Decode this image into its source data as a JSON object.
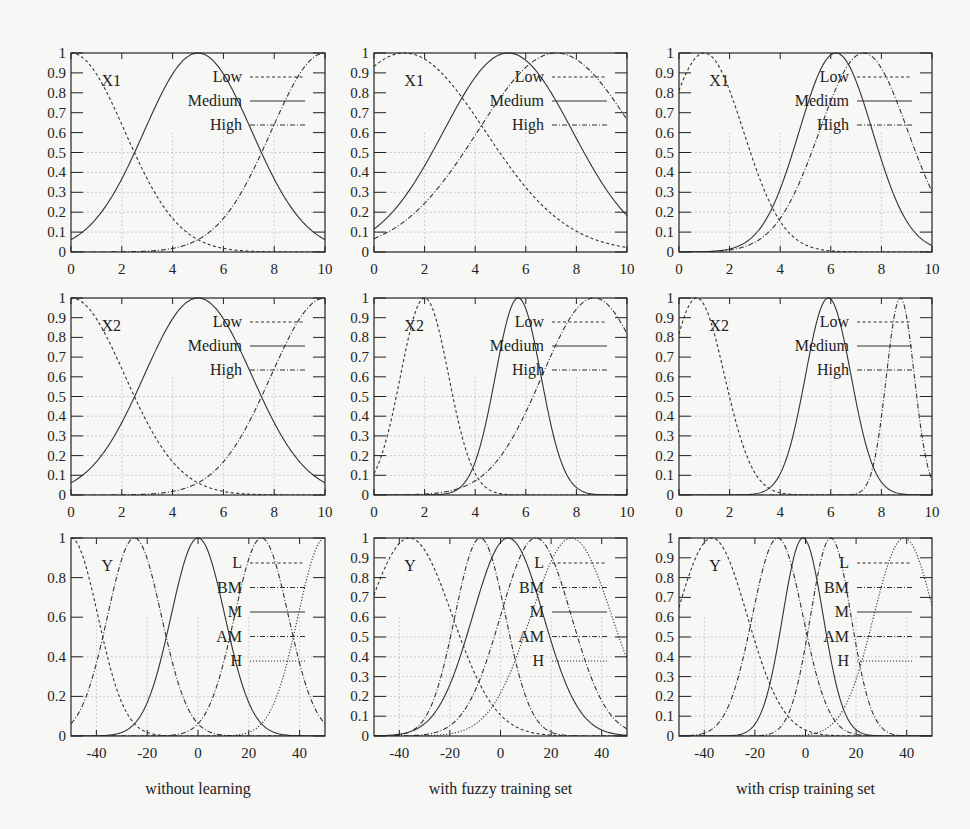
{
  "figure": {
    "rows": [
      "X1",
      "X2",
      "Y"
    ],
    "columns": [
      "without learning",
      "with fuzzy training set",
      "with crisp training set"
    ]
  },
  "chart_data": [
    {
      "type": "line",
      "id": "x1-without",
      "row": 0,
      "col": 0,
      "var_label": "X1",
      "xlabel": "",
      "ylabel": "",
      "xlim": [
        0,
        10
      ],
      "ylim": [
        0,
        1
      ],
      "xticks": [
        0,
        2,
        4,
        6,
        8,
        10
      ],
      "yticks": [
        0,
        0.1,
        0.2,
        0.3,
        0.4,
        0.5,
        0.6,
        0.7,
        0.8,
        0.9,
        1
      ],
      "ytick_labels": [
        "0",
        "0.1",
        "0.2",
        "0.3",
        "0.4",
        "0.5",
        "0.6",
        "0.7",
        "0.8",
        "0.9",
        "1"
      ],
      "grid": true,
      "legend_position": "upper right",
      "series": [
        {
          "name": "Low",
          "style": "dashed",
          "center": 0,
          "sigma": 2.12
        },
        {
          "name": "Medium",
          "style": "solid",
          "center": 5,
          "sigma": 2.12
        },
        {
          "name": "High",
          "style": "dashdot",
          "center": 10,
          "sigma": 2.12
        }
      ]
    },
    {
      "type": "line",
      "id": "x1-fuzzy",
      "row": 0,
      "col": 1,
      "var_label": "X1",
      "xlabel": "",
      "ylabel": "",
      "xlim": [
        0,
        10
      ],
      "ylim": [
        0,
        1
      ],
      "xticks": [
        0,
        2,
        4,
        6,
        8,
        10
      ],
      "yticks": [
        0,
        0.1,
        0.2,
        0.3,
        0.4,
        0.5,
        0.6,
        0.7,
        0.8,
        0.9,
        1
      ],
      "ytick_labels": [
        "0",
        "0.1",
        "0.2",
        "0.3",
        "0.4",
        "0.5",
        "0.6",
        "0.7",
        "0.8",
        "0.9",
        "1"
      ],
      "grid": true,
      "legend_position": "upper right",
      "series": [
        {
          "name": "Low",
          "style": "dashed",
          "center": 1.2,
          "sigma": 3.2
        },
        {
          "name": "Medium",
          "style": "solid",
          "center": 5.3,
          "sigma": 2.55
        },
        {
          "name": "High",
          "style": "dashdot",
          "center": 7.2,
          "sigma": 3.1
        }
      ]
    },
    {
      "type": "line",
      "id": "x1-crisp",
      "row": 0,
      "col": 2,
      "var_label": "X1",
      "xlabel": "",
      "ylabel": "",
      "xlim": [
        0,
        10
      ],
      "ylim": [
        0,
        1
      ],
      "xticks": [
        0,
        2,
        4,
        6,
        8,
        10
      ],
      "yticks": [
        0,
        0.1,
        0.2,
        0.3,
        0.4,
        0.5,
        0.6,
        0.7,
        0.8,
        0.9,
        1
      ],
      "ytick_labels": [
        "0",
        "0.1",
        "0.2",
        "0.3",
        "0.4",
        "0.5",
        "0.6",
        "0.7",
        "0.8",
        "0.9",
        "1"
      ],
      "grid": true,
      "legend_position": "upper right",
      "series": [
        {
          "name": "Low",
          "style": "dashed",
          "center": 1.0,
          "sigma": 1.55
        },
        {
          "name": "Medium",
          "style": "solid",
          "center": 6.2,
          "sigma": 1.45
        },
        {
          "name": "High",
          "style": "dashdot",
          "center": 7.3,
          "sigma": 1.75
        }
      ]
    },
    {
      "type": "line",
      "id": "x2-without",
      "row": 1,
      "col": 0,
      "var_label": "X2",
      "xlabel": "",
      "ylabel": "",
      "xlim": [
        0,
        10
      ],
      "ylim": [
        0,
        1
      ],
      "xticks": [
        0,
        2,
        4,
        6,
        8,
        10
      ],
      "yticks": [
        0,
        0.1,
        0.2,
        0.3,
        0.4,
        0.5,
        0.6,
        0.7,
        0.8,
        0.9,
        1
      ],
      "ytick_labels": [
        "0",
        "0.1",
        "0.2",
        "0.3",
        "0.4",
        "0.5",
        "0.6",
        "0.7",
        "0.8",
        "0.9",
        "1"
      ],
      "grid": true,
      "legend_position": "upper right",
      "series": [
        {
          "name": "Low",
          "style": "dashed",
          "center": 0,
          "sigma": 2.12
        },
        {
          "name": "Medium",
          "style": "solid",
          "center": 5,
          "sigma": 2.12
        },
        {
          "name": "High",
          "style": "dashdot",
          "center": 10,
          "sigma": 2.12
        }
      ]
    },
    {
      "type": "line",
      "id": "x2-fuzzy",
      "row": 1,
      "col": 1,
      "var_label": "X2",
      "xlabel": "",
      "ylabel": "",
      "xlim": [
        0,
        10
      ],
      "ylim": [
        0,
        1
      ],
      "xticks": [
        0,
        2,
        4,
        6,
        8,
        10
      ],
      "yticks": [
        0,
        0.1,
        0.2,
        0.3,
        0.4,
        0.5,
        0.6,
        0.7,
        0.8,
        0.9,
        1
      ],
      "ytick_labels": [
        "0",
        "0.1",
        "0.2",
        "0.3",
        "0.4",
        "0.5",
        "0.6",
        "0.7",
        "0.8",
        "0.9",
        "1"
      ],
      "grid": true,
      "legend_position": "upper right",
      "series": [
        {
          "name": "Low",
          "style": "dashed",
          "center": 2.0,
          "sigma": 0.95
        },
        {
          "name": "Medium",
          "style": "solid",
          "center": 5.7,
          "sigma": 0.9
        },
        {
          "name": "High",
          "style": "dashdot",
          "center": 8.7,
          "sigma": 2.05
        }
      ]
    },
    {
      "type": "line",
      "id": "x2-crisp",
      "row": 1,
      "col": 2,
      "var_label": "X2",
      "xlabel": "",
      "ylabel": "",
      "xlim": [
        0,
        10
      ],
      "ylim": [
        0,
        1
      ],
      "xticks": [
        0,
        2,
        4,
        6,
        8,
        10
      ],
      "yticks": [
        0,
        0.1,
        0.2,
        0.3,
        0.4,
        0.5,
        0.6,
        0.7,
        0.8,
        0.9,
        1
      ],
      "ytick_labels": [
        "0",
        "0.1",
        "0.2",
        "0.3",
        "0.4",
        "0.5",
        "0.6",
        "0.7",
        "0.8",
        "0.9",
        "1"
      ],
      "grid": true,
      "legend_position": "upper right",
      "series": [
        {
          "name": "Low",
          "style": "dashed",
          "center": 0.7,
          "sigma": 1.1
        },
        {
          "name": "Medium",
          "style": "solid",
          "center": 5.9,
          "sigma": 0.9
        },
        {
          "name": "High",
          "style": "dashdot",
          "center": 8.75,
          "sigma": 0.55
        }
      ]
    },
    {
      "type": "line",
      "id": "y-without",
      "row": 2,
      "col": 0,
      "var_label": "Y",
      "xlabel": "without learning",
      "ylabel": "",
      "xlim": [
        -50,
        50
      ],
      "ylim": [
        0,
        1
      ],
      "xticks": [
        -40,
        -20,
        0,
        20,
        40
      ],
      "yticks": [
        0,
        0.2,
        0.4,
        0.6,
        0.8,
        1
      ],
      "ytick_labels": [
        "0",
        "0.2",
        "0.4",
        "0.6",
        "0.8",
        "1"
      ],
      "grid": true,
      "legend_position": "upper right",
      "series": [
        {
          "name": "L",
          "style": "dashed",
          "center": -50,
          "sigma": 10.6
        },
        {
          "name": "BM",
          "style": "dashdot",
          "center": -25,
          "sigma": 10.6
        },
        {
          "name": "M",
          "style": "solid",
          "center": 0,
          "sigma": 10.6
        },
        {
          "name": "AM",
          "style": "dashdot",
          "center": 25,
          "sigma": 10.6
        },
        {
          "name": "H",
          "style": "dotted",
          "center": 50,
          "sigma": 10.6
        }
      ]
    },
    {
      "type": "line",
      "id": "y-fuzzy",
      "row": 2,
      "col": 1,
      "var_label": "Y",
      "xlabel": "with fuzzy training set",
      "ylabel": "",
      "xlim": [
        -50,
        50
      ],
      "ylim": [
        0,
        1
      ],
      "xticks": [
        -40,
        -20,
        0,
        20,
        40
      ],
      "yticks": [
        0,
        0.1,
        0.2,
        0.3,
        0.4,
        0.5,
        0.6,
        0.7,
        0.8,
        0.9,
        1
      ],
      "ytick_labels": [
        "0",
        "0.1",
        "0.2",
        "0.3",
        "0.4",
        "0.5",
        "0.6",
        "0.7",
        "0.8",
        "0.9",
        "1"
      ],
      "grid": true,
      "legend_position": "upper right",
      "series": [
        {
          "name": "L",
          "style": "dashed",
          "center": -36,
          "sigma": 17
        },
        {
          "name": "BM",
          "style": "dashdot",
          "center": -8,
          "sigma": 10
        },
        {
          "name": "M",
          "style": "solid",
          "center": 3,
          "sigma": 14
        },
        {
          "name": "AM",
          "style": "dashdot",
          "center": 14,
          "sigma": 14
        },
        {
          "name": "H",
          "style": "dotted",
          "center": 28,
          "sigma": 16
        }
      ]
    },
    {
      "type": "line",
      "id": "y-crisp",
      "row": 2,
      "col": 2,
      "var_label": "Y",
      "xlabel": "with crisp training set",
      "ylabel": "",
      "xlim": [
        -50,
        50
      ],
      "ylim": [
        0,
        1
      ],
      "xticks": [
        -40,
        -20,
        0,
        20,
        40
      ],
      "yticks": [
        0,
        0.1,
        0.2,
        0.3,
        0.4,
        0.5,
        0.6,
        0.7,
        0.8,
        0.9,
        1
      ],
      "ytick_labels": [
        "0",
        "0.1",
        "0.2",
        "0.3",
        "0.4",
        "0.5",
        "0.6",
        "0.7",
        "0.8",
        "0.9",
        "1"
      ],
      "grid": true,
      "legend_position": "upper right",
      "series": [
        {
          "name": "L",
          "style": "dashed",
          "center": -37,
          "sigma": 14
        },
        {
          "name": "BM",
          "style": "dashdot",
          "center": -11,
          "sigma": 10
        },
        {
          "name": "M",
          "style": "solid",
          "center": -1,
          "sigma": 8
        },
        {
          "name": "AM",
          "style": "dashdot",
          "center": 10,
          "sigma": 8
        },
        {
          "name": "H",
          "style": "dotted",
          "center": 39,
          "sigma": 12
        }
      ]
    }
  ],
  "layout": {
    "col_frames": [
      [
        71,
        325
      ],
      [
        374,
        627
      ],
      [
        679,
        932
      ]
    ],
    "row_frames": [
      [
        53,
        252
      ],
      [
        298,
        495
      ],
      [
        538,
        736
      ]
    ]
  }
}
